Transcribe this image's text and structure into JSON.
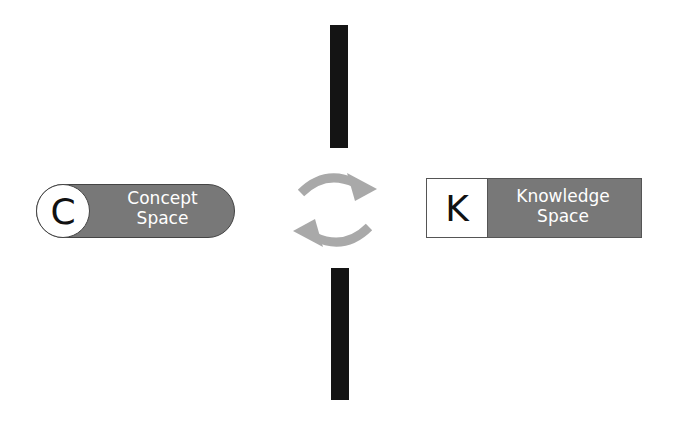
{
  "diagram": {
    "concept": {
      "letter": "C",
      "line1": "Concept",
      "line2": "Space"
    },
    "knowledge": {
      "letter": "K",
      "line1": "Knowledge",
      "line2": "Space"
    },
    "cycle_icon": "refresh-cycle-arrows",
    "colors": {
      "box_fill": "#787878",
      "bar": "#141414",
      "arrow": "#a9a9a9"
    }
  }
}
